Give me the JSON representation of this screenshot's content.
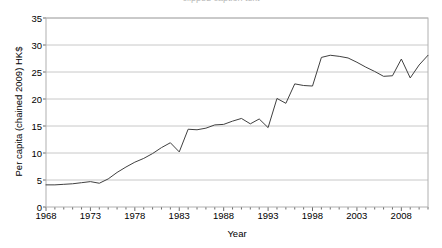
{
  "chart_data": {
    "type": "line",
    "title": "",
    "xlabel": "Year",
    "ylabel": "Per capita (chained 2009) HK$",
    "xlim": [
      1968,
      2011
    ],
    "ylim": [
      0,
      35
    ],
    "yticks": [
      0,
      5,
      10,
      15,
      20,
      25,
      30,
      35
    ],
    "xticks": [
      1968,
      1973,
      1978,
      1983,
      1988,
      1993,
      1998,
      2003,
      2008
    ],
    "grid": "horizontal",
    "legend": "none",
    "line_color": "#404040",
    "series": [
      {
        "name": "Per capita (chained 2009) HK$",
        "x": [
          1968,
          1969,
          1970,
          1971,
          1972,
          1973,
          1974,
          1975,
          1976,
          1977,
          1978,
          1979,
          1980,
          1981,
          1982,
          1983,
          1984,
          1985,
          1986,
          1987,
          1988,
          1989,
          1990,
          1991,
          1992,
          1993,
          1994,
          1995,
          1996,
          1997,
          1998,
          1999,
          2000,
          2001,
          2002,
          2003,
          2004,
          2005,
          2006,
          2007,
          2008,
          2009,
          2010,
          2011
        ],
        "values": [
          4.1,
          4.1,
          4.2,
          4.3,
          4.5,
          4.7,
          4.4,
          5.2,
          6.4,
          7.4,
          8.3,
          9.0,
          9.9,
          11.0,
          11.9,
          10.2,
          14.4,
          14.3,
          14.6,
          15.2,
          15.3,
          15.9,
          16.4,
          15.4,
          16.3,
          14.7,
          20.1,
          19.2,
          22.8,
          22.5,
          22.4,
          27.7,
          28.1,
          27.9,
          27.6,
          26.8,
          25.9,
          25.1,
          24.2,
          24.3,
          27.4,
          23.9,
          26.3,
          28.1
        ]
      }
    ]
  },
  "axis": {
    "y_tick_labels": [
      "35",
      "30",
      "25",
      "20",
      "15",
      "10",
      "5",
      "0"
    ],
    "x_tick_labels": [
      "1968",
      "1973",
      "1978",
      "1983",
      "1988",
      "1993",
      "1998",
      "2003",
      "2008"
    ],
    "x_axis_title": "Year",
    "y_axis_title": "Per capita (chained 2009) HK$"
  },
  "title_remnant": "clipped caption text"
}
